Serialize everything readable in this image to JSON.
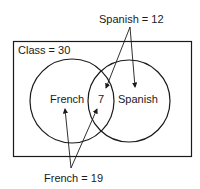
{
  "diagram": {
    "type": "venn",
    "universe_label": "Class = 30",
    "sets": [
      {
        "name": "French",
        "label": "French",
        "total_label": "French = 19"
      },
      {
        "name": "Spanish",
        "label": "Spanish",
        "total_label": "Spanish = 12"
      }
    ],
    "intersection_value": "7",
    "colors": {
      "stroke": "#1a1a1a",
      "background": "#ffffff"
    }
  }
}
